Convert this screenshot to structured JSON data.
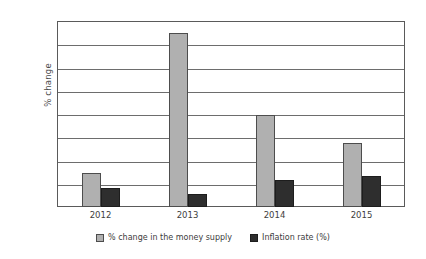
{
  "chart_data": {
    "type": "bar",
    "title": "",
    "xlabel": "",
    "ylabel": "% change",
    "ylim": [
      0,
      16
    ],
    "yticks": [
      0,
      2,
      4,
      6,
      8,
      10,
      12,
      14,
      16
    ],
    "grid": true,
    "legend_position": "bottom",
    "categories": [
      "2012",
      "2013",
      "2014",
      "2015"
    ],
    "series": [
      {
        "name": "% change in the money supply",
        "color": "#b0b0b0",
        "values": [
          2.9,
          15.0,
          7.9,
          5.5
        ]
      },
      {
        "name": "Inflation rate (%)",
        "color": "#2e2e2e",
        "values": [
          1.6,
          1.1,
          2.3,
          2.7
        ]
      }
    ]
  }
}
